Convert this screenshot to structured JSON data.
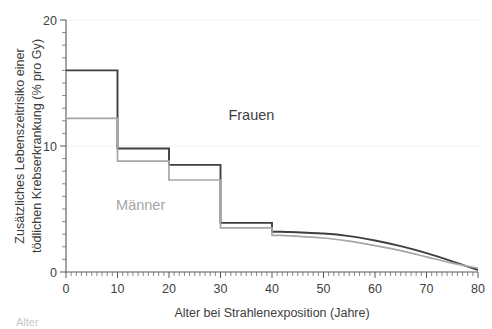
{
  "chart_data": {
    "type": "line",
    "title": "",
    "xlabel": "Alter bei Strahlenexposition (Jahre)",
    "ylabel_line1": "Zusätzliches Lebenszeitrisiko einer",
    "ylabel_line2": "tödlichen Krebserkrankung (% pro Gy)",
    "xlim": [
      0,
      80
    ],
    "ylim": [
      0,
      20
    ],
    "xticks": [
      0,
      10,
      20,
      30,
      40,
      50,
      60,
      70,
      80
    ],
    "yticks": [
      0,
      10,
      20
    ],
    "y_minor_step": 1,
    "x_minor_step": 1,
    "grid": "horizontal-major-faint",
    "legend": "inline-annotations",
    "series": [
      {
        "name": "Frauen",
        "color": "#3f3f3f",
        "label_x": 36,
        "label_y": 12.1,
        "step_segments": [
          {
            "x0": 0,
            "x1": 10,
            "value": 16.0
          },
          {
            "x0": 10,
            "x1": 20,
            "value": 9.8
          },
          {
            "x0": 20,
            "x1": 30,
            "value": 8.5
          },
          {
            "x0": 30,
            "x1": 40,
            "value": 3.9
          },
          {
            "x0": 40,
            "x1": 42,
            "value": 3.2
          }
        ],
        "tail_points": [
          {
            "x": 42,
            "y": 3.2
          },
          {
            "x": 50,
            "y": 3.05
          },
          {
            "x": 55,
            "y": 2.85
          },
          {
            "x": 60,
            "y": 2.5
          },
          {
            "x": 65,
            "y": 2.05
          },
          {
            "x": 70,
            "y": 1.5
          },
          {
            "x": 75,
            "y": 0.85
          },
          {
            "x": 80,
            "y": 0.15
          }
        ]
      },
      {
        "name": "Männer",
        "color": "#a6a6a6",
        "label_x": 14.5,
        "label_y": 4.9,
        "step_segments": [
          {
            "x0": 0,
            "x1": 10,
            "value": 12.2
          },
          {
            "x0": 10,
            "x1": 20,
            "value": 8.8
          },
          {
            "x0": 20,
            "x1": 30,
            "value": 7.3
          },
          {
            "x0": 30,
            "x1": 40,
            "value": 3.5
          },
          {
            "x0": 40,
            "x1": 42,
            "value": 2.9
          }
        ],
        "tail_points": [
          {
            "x": 42,
            "y": 2.9
          },
          {
            "x": 50,
            "y": 2.7
          },
          {
            "x": 55,
            "y": 2.45
          },
          {
            "x": 60,
            "y": 2.1
          },
          {
            "x": 65,
            "y": 1.7
          },
          {
            "x": 70,
            "y": 1.2
          },
          {
            "x": 75,
            "y": 0.7
          },
          {
            "x": 80,
            "y": 0.3
          }
        ]
      }
    ]
  },
  "caption": {
    "text": "Alter"
  }
}
